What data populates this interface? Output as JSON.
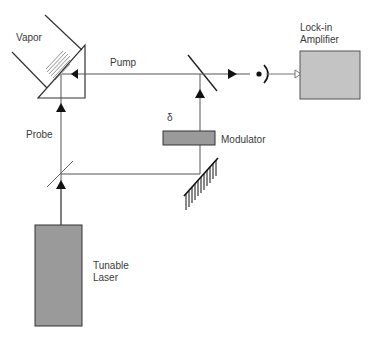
{
  "diagram": {
    "type": "optical-setup",
    "colors": {
      "line": "#555555",
      "box_fill": "#9a9a9a",
      "amp_fill": "#c4c4c4",
      "stroke": "#333333"
    },
    "components": {
      "vapor": {
        "label": "Vapor"
      },
      "pump": {
        "label": "Pump"
      },
      "probe": {
        "label": "Probe"
      },
      "delta": {
        "label": "δ"
      },
      "modulator": {
        "label": "Modulator"
      },
      "lockin": {
        "label": "Lock-in\nAmplifier"
      },
      "laser": {
        "label": "Tunable\nLaser"
      }
    },
    "connections": [
      {
        "from": "tunable-laser",
        "to": "beam-splitter",
        "beam": "laser"
      },
      {
        "from": "beam-splitter",
        "to": "vapor-cell",
        "beam": "probe"
      },
      {
        "from": "beam-splitter",
        "to": "grating-mirror",
        "beam": "split"
      },
      {
        "from": "grating-mirror",
        "to": "modulator",
        "beam": "delayed"
      },
      {
        "from": "modulator",
        "to": "pump-mirror",
        "beam": "modulated"
      },
      {
        "from": "pump-mirror",
        "to": "vapor-cell",
        "beam": "pump"
      },
      {
        "from": "pump-mirror",
        "to": "photodetector",
        "beam": "signal"
      },
      {
        "from": "photodetector",
        "to": "lock-in-amplifier",
        "beam": "electrical"
      }
    ]
  }
}
